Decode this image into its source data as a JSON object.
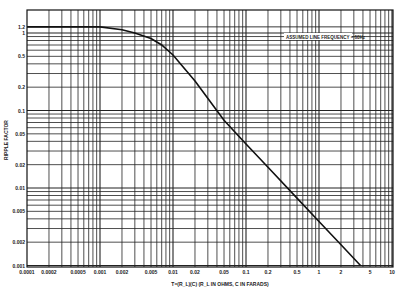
{
  "chart_data": {
    "type": "line",
    "title": "",
    "xlabel": "T=(R_L)(C)  (R_L IN OHMS, C IN FARADS)",
    "ylabel": "RIPPLE FACTOR",
    "xscale": "log",
    "yscale": "log",
    "xlim": [
      0.0001,
      11
    ],
    "ylim": [
      0.001,
      1.65
    ],
    "grid": true,
    "legend": "none",
    "annotation": "ASSUMED LINE FREQUENCY = 60Hz",
    "x_ticks": [
      "0.0001",
      "0.0002",
      "0.0005",
      "0.001",
      "0.002",
      "0.005",
      "0.01",
      "0.02",
      "0.05",
      "0.1",
      "0.2",
      "0.5",
      "1",
      "2",
      "5",
      "10"
    ],
    "y_ticks": [
      "1.2",
      "1",
      "0.5",
      "0.2",
      "0.1",
      "0.05",
      "0.02",
      "0.01",
      "0.005",
      "0.002",
      "0.001"
    ],
    "series": [
      {
        "name": "Ripple factor",
        "x": [
          0.0001,
          0.0005,
          0.001,
          0.002,
          0.003,
          0.005,
          0.007,
          0.01,
          0.02,
          0.05,
          0.1,
          0.2,
          0.5,
          1,
          2,
          3.7
        ],
        "y": [
          1.2,
          1.2,
          1.2,
          1.1,
          1.0,
          0.85,
          0.7,
          0.52,
          0.24,
          0.075,
          0.037,
          0.0185,
          0.0074,
          0.0037,
          0.00185,
          0.001
        ]
      }
    ]
  }
}
